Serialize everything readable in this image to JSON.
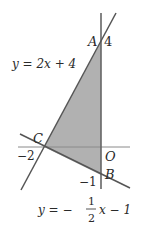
{
  "figure": {
    "colors": {
      "line": "#555555",
      "axis": "#888888",
      "fill": "#a8a8a8",
      "text": "#2a2a2a"
    },
    "points": {
      "A": {
        "label": "A",
        "value_label": "4"
      },
      "B": {
        "label": "B",
        "value_label": "−1"
      },
      "C": {
        "label": "C",
        "value_label": "−2"
      },
      "O": {
        "label": "O"
      }
    },
    "lines": {
      "line1": {
        "equation": "y = 2x + 4"
      },
      "line2": {
        "equation_prefix": "y = −",
        "frac_num": "1",
        "frac_den": "2",
        "equation_suffix": "x − 1"
      }
    }
  }
}
